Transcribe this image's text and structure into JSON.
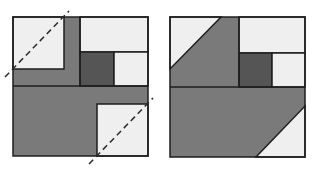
{
  "figure": {
    "colors": {
      "light": "#efefef",
      "medium": "#7a7a7a",
      "dark": "#555555",
      "stroke": "#1e1e1e",
      "background": "#ffffff"
    },
    "left_block": {
      "label": "block-before-cut",
      "dashed_lines": 2
    },
    "right_block": {
      "label": "block-after-cut"
    }
  }
}
